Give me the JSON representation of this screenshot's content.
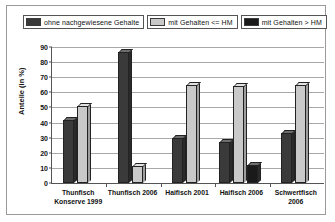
{
  "legend": {
    "entries": [
      {
        "label": "ohne nachgewiesene Gehalte",
        "color": "#3a3a3a",
        "key": "no-detected-levels"
      },
      {
        "label": "mit Gehalten <= HM",
        "color": "#c9c9c9",
        "key": "levels-below-or-equal-hm"
      },
      {
        "label": "mit Gehalten > HM",
        "color": "#1a1a1a",
        "key": "levels-above-hm"
      }
    ]
  },
  "axes": {
    "y_title": "Anteile (in %)",
    "y_ticks": [
      "0",
      "10",
      "20",
      "30",
      "40",
      "50",
      "60",
      "70",
      "80",
      "90"
    ],
    "x_labels": [
      "Thunfisch\nKonserve 1999",
      "Thunfisch 2006",
      "Haifisch 2001",
      "Haifisch 2006",
      "Schwertfisch\n2006"
    ]
  },
  "chart_data": {
    "type": "bar",
    "title": "",
    "xlabel": "",
    "ylabel": "Anteile (in %)",
    "ylim": [
      0,
      90
    ],
    "yticks": [
      0,
      10,
      20,
      30,
      40,
      50,
      60,
      70,
      80,
      90
    ],
    "grid": true,
    "legend_position": "top",
    "categories": [
      "Thunfisch Konserve 1999",
      "Thunfisch 2006",
      "Haifisch 2001",
      "Haifisch 2006",
      "Schwertfisch 2006"
    ],
    "series": [
      {
        "name": "ohne nachgewiesene Gehalte",
        "color": "#3a3a3a",
        "values": [
          42,
          87,
          30,
          27,
          33
        ]
      },
      {
        "name": "mit Gehalten <= HM",
        "color": "#c9c9c9",
        "values": [
          51,
          11,
          65,
          64,
          65
        ]
      },
      {
        "name": "mit Gehalten > HM",
        "color": "#1a1a1a",
        "values": [
          0,
          0,
          0,
          12,
          0
        ]
      }
    ]
  }
}
